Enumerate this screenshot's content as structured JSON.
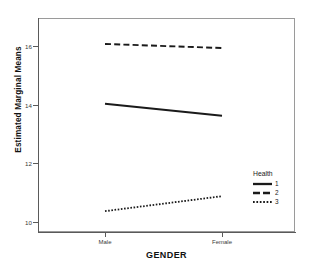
{
  "chart_data": {
    "type": "line",
    "title": "",
    "xlabel": "GENDER",
    "ylabel": "Estimated Marginal Means",
    "categories": [
      "Male",
      "Female"
    ],
    "yticks": [
      10,
      12,
      14,
      16
    ],
    "ylim": [
      9.2,
      16.6
    ],
    "grid": false,
    "legend_position": "right-inside",
    "legend_title": "Health",
    "series": [
      {
        "name": "1",
        "style": "solid",
        "values": [
          14.03,
          13.62
        ]
      },
      {
        "name": "2",
        "style": "dashed",
        "values": [
          16.07,
          15.93
        ]
      },
      {
        "name": "3",
        "style": "dotted",
        "values": [
          10.37,
          10.88
        ]
      }
    ]
  },
  "axis": {
    "y_tick_labels": [
      "16",
      "14",
      "12",
      "10"
    ],
    "x_tick_labels": [
      "Male",
      "Female"
    ],
    "y_title": "Estimated Marginal Means",
    "x_title": "GENDER"
  },
  "legend": {
    "title": "Health",
    "items": [
      {
        "label": "1",
        "style": "solid"
      },
      {
        "label": "2",
        "style": "dashed"
      },
      {
        "label": "3",
        "style": "dotted"
      }
    ]
  },
  "colors": {
    "line": "#1a1a1a",
    "frame": "#9a9a9a",
    "axis": "#5a5a5a",
    "background": "#ffffff",
    "text": "#1a1a1a"
  }
}
